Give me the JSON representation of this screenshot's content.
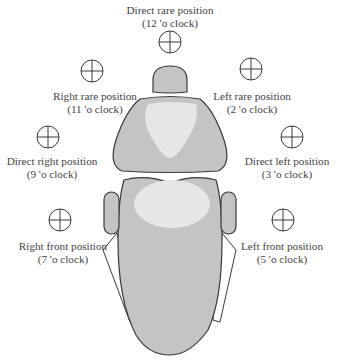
{
  "diagram": {
    "colors": {
      "chair_fill": "#c4c4c4",
      "chair_highlight": "#e6e6e6",
      "outline": "#3a3a3a",
      "text": "#444444"
    },
    "positions": [
      {
        "id": "direct-rare",
        "name": "Direct rare position",
        "clock": "(12 'o clock)"
      },
      {
        "id": "right-rare",
        "name": "Right rare position",
        "clock": "(11 'o clock)"
      },
      {
        "id": "left-rare",
        "name": "Left rare position",
        "clock": "(2 'o clock)"
      },
      {
        "id": "direct-right",
        "name": "Direct right position",
        "clock": "(9 'o clock)"
      },
      {
        "id": "direct-left",
        "name": "Direct left position",
        "clock": "(3 'o clock)"
      },
      {
        "id": "right-front",
        "name": "Right front position",
        "clock": "(7 'o clock)"
      },
      {
        "id": "left-front",
        "name": "Left front position",
        "clock": "(5 'o clock)"
      }
    ]
  }
}
